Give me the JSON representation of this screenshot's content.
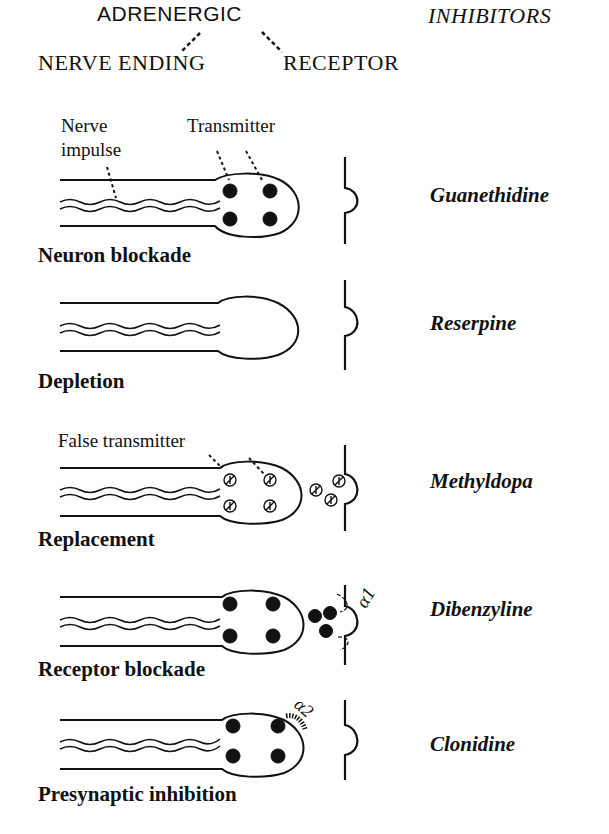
{
  "header": {
    "adrenergic": "ADRENERGIC",
    "inhibitors": "INHIBITORS",
    "nerve_ending": "NERVE ENDING",
    "receptor": "RECEPTOR"
  },
  "annotations": {
    "nerve_impulse_line1": "Nerve",
    "nerve_impulse_line2": "impulse",
    "transmitter": "Transmitter",
    "false_transmitter": "False transmitter",
    "alpha1": "α1",
    "alpha2": "α2"
  },
  "rows": [
    {
      "mechanism": "Neuron blockade",
      "drug": "Guanethidine",
      "vesicles": "filled",
      "released": "none"
    },
    {
      "mechanism": "Depletion",
      "drug": "Reserpine",
      "vesicles": "empty",
      "released": "none"
    },
    {
      "mechanism": "Replacement",
      "drug": "Methyldopa",
      "vesicles": "false-transmitter",
      "released": "false-transmitter"
    },
    {
      "mechanism": "Receptor blockade",
      "drug": "Dibenzyline",
      "vesicles": "filled",
      "released": "transmitter-blocked-at-alpha1"
    },
    {
      "mechanism": "Presynaptic inhibition",
      "drug": "Clonidine",
      "vesicles": "filled",
      "released": "alpha2-presynaptic"
    }
  ]
}
